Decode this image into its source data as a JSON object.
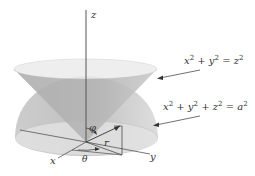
{
  "figure": {
    "axes": {
      "x": "x",
      "y": "y",
      "z": "z"
    },
    "angles": {
      "phi": "φ",
      "theta": "θ"
    },
    "radius_label": "r",
    "equations": {
      "cone": {
        "lhs": "x",
        "p1": "2",
        "plus1": " + y",
        "p2": "2",
        "eq": " = z",
        "p3": "2"
      },
      "sphere": {
        "lhs": "x",
        "p1": "2",
        "plus1": " + y",
        "p2": "2",
        "plus2": " + z",
        "p3": "2",
        "eq": " = a",
        "p4": "2"
      }
    },
    "colors": {
      "cone_fill": "#bdbdbd",
      "cone_rim": "#e6e6e6",
      "sphere_fill": "#c8c8c8",
      "base_fill": "#dcdcdc",
      "axis": "#555555"
    }
  }
}
